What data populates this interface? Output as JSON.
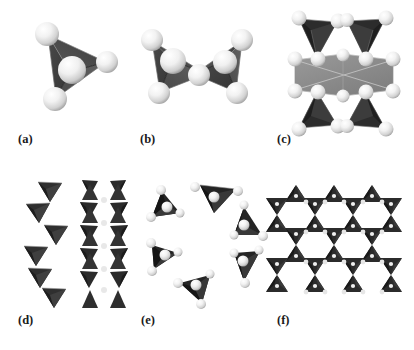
{
  "figure": {
    "kind": "crystal-structure-diagram",
    "background_color": "#ffffff",
    "colors": {
      "tetrahedron_dark": "#3b3b3b",
      "tetrahedron_mid": "#5a5a5a",
      "tetrahedron_light": "#6e6e6e",
      "tetrahedron_black": "#232323",
      "octahedron_gray": "#8d8d8d",
      "octahedron_gray_dark": "#6f6f6f",
      "sphere_white": "#f4f4f4",
      "sphere_shadow": "#b9b9b9",
      "edge_line": "#d8d8d8",
      "label_text": "#1a1a1a"
    },
    "panels": [
      {
        "id": "a",
        "label": "(a)",
        "title": "Isolated tetrahedron",
        "description": "Single SiO4 tetrahedron with four white oxygen spheres at its vertices",
        "tetrahedra_count": 1,
        "sphere_count": 4
      },
      {
        "id": "b",
        "label": "(b)",
        "title": "Corner-sharing tetrahedra pair",
        "description": "Two tetrahedra joined through one shared bridging oxygen sphere",
        "tetrahedra_count": 2,
        "sphere_count": 7
      },
      {
        "id": "c",
        "label": "(c)",
        "title": "Octahedron with four tetrahedra",
        "description": "Central light-gray octahedron flanked above and below by two pairs of dark tetrahedra",
        "tetrahedra_count": 4,
        "octahedra_count": 1,
        "sphere_count": 18
      },
      {
        "id": "d",
        "label": "(d)",
        "title": "Single and double chains",
        "description": "Left: single chain of six alternating tetrahedra. Right: double chain with hexagonal voids",
        "single_chain_units": 6,
        "double_chain_rows": 7
      },
      {
        "id": "e",
        "label": "(e)",
        "title": "Six-membered ring",
        "description": "Closed ring of six corner-linked tetrahedra pointing outward",
        "tetrahedra_count": 6,
        "ring_size": 6
      },
      {
        "id": "f",
        "label": "(f)",
        "title": "Infinite tetrahedral sheet",
        "description": "Two-dimensional sheet of corner-linked tetrahedra forming hexagonal rings",
        "grid_rows": 4,
        "grid_cols": 4
      }
    ],
    "labels": [
      {
        "text": "(a)",
        "x": 18,
        "y": 139
      },
      {
        "text": "(b)",
        "x": 140,
        "y": 139
      },
      {
        "text": "(c)",
        "x": 277,
        "y": 139
      },
      {
        "text": "(d)",
        "x": 18,
        "y": 319
      },
      {
        "text": "(e)",
        "x": 141,
        "y": 319
      },
      {
        "text": "(f)",
        "x": 277,
        "y": 319
      }
    ]
  }
}
